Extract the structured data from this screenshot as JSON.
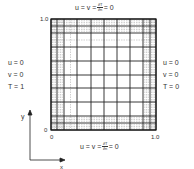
{
  "diagram": {
    "type": "computational mesh with boundary conditions",
    "top_bc": {
      "prefix": "u = v = ",
      "frac_num": "∂T",
      "frac_den": "∂n",
      "suffix": " = 0"
    },
    "bottom_bc": {
      "prefix": "u = v = ",
      "frac_num": "∂T",
      "frac_den": "∂n",
      "suffix": " = 0"
    },
    "left_bc": {
      "line1": "u = 0",
      "line2": "v = 0",
      "line3": "T = 1"
    },
    "right_bc": {
      "line1": "u = 0",
      "line2": "v = 0",
      "line3": "T = 0"
    },
    "ticks": {
      "y_top": "1.0",
      "y_bottom": "0",
      "x_left": "0",
      "x_right": "1.0"
    },
    "axes": {
      "x_label": "x",
      "y_label": "y"
    },
    "mesh": {
      "solid_x": [
        51,
        57,
        64,
        77,
        91,
        104,
        117,
        130,
        143,
        150,
        156
      ],
      "solid_y": [
        19,
        26,
        33,
        47,
        61,
        75,
        88,
        102,
        116,
        123,
        130
      ]
    }
  }
}
